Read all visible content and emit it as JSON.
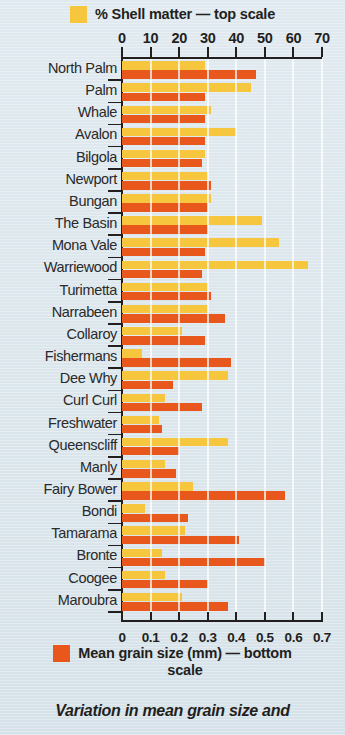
{
  "legend": {
    "top": {
      "label": "% Shell matter — top scale",
      "color": "#f6c63f",
      "swatch_name": "yellow-swatch"
    },
    "bottom": {
      "label": "Mean grain size (mm) — bottom scale",
      "color": "#e8581c",
      "swatch_name": "orange-swatch"
    }
  },
  "caption": "Variation in mean grain size and",
  "chart_data": {
    "type": "bar",
    "orientation": "horizontal",
    "title": "",
    "subtitle": "",
    "grid": true,
    "legend_position": "top-and-bottom",
    "categories": [
      "North Palm",
      "Palm",
      "Whale",
      "Avalon",
      "Bilgola",
      "Newport",
      "Bungan",
      "The Basin",
      "Mona Vale",
      "Warriewood",
      "Turimetta",
      "Narrabeen",
      "Collaroy",
      "Fishermans",
      "Dee Why",
      "Curl Curl",
      "Freshwater",
      "Queenscliff",
      "Manly",
      "Fairy Bower",
      "Bondi",
      "Tamarama",
      "Bronte",
      "Coogee",
      "Maroubra"
    ],
    "series": [
      {
        "name": "% Shell matter — top scale",
        "color": "#f6c63f",
        "axis": "top",
        "xlabel": "% Shell matter",
        "xlim": [
          0,
          70
        ],
        "ticks": [
          0,
          10,
          20,
          30,
          40,
          50,
          60,
          70
        ],
        "tick_labels": [
          "0",
          "10",
          "20",
          "30",
          "40",
          "50",
          "60",
          "70"
        ],
        "values": [
          29,
          45,
          31,
          40,
          29,
          30,
          31,
          49,
          55,
          65,
          30,
          30,
          21,
          7,
          37,
          15,
          13,
          37,
          15,
          25,
          8,
          22,
          14,
          15,
          21
        ]
      },
      {
        "name": "Mean grain size (mm) — bottom scale",
        "color": "#e8581c",
        "axis": "bottom",
        "xlabel": "Mean grain size (mm)",
        "xlim": [
          0,
          0.7
        ],
        "ticks": [
          0,
          0.1,
          0.2,
          0.3,
          0.4,
          0.5,
          0.6,
          0.7
        ],
        "tick_labels": [
          "0",
          "0.1",
          "0.2",
          "0.3",
          "0.4",
          "0.5",
          "0.6",
          "0.7"
        ],
        "values": [
          0.47,
          0.29,
          0.29,
          0.29,
          0.28,
          0.31,
          0.3,
          0.3,
          0.29,
          0.28,
          0.31,
          0.36,
          0.29,
          0.38,
          0.18,
          0.28,
          0.14,
          0.2,
          0.19,
          0.57,
          0.23,
          0.41,
          0.5,
          0.3,
          0.37
        ]
      }
    ]
  }
}
